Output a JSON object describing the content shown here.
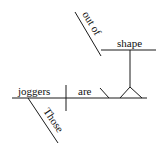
{
  "diagram": {
    "type": "sentence-diagram",
    "sentence": "Those joggers are out of shape",
    "words": {
      "subject": "joggers",
      "verb": "are",
      "subject_modifier": "Those",
      "predicate_prepositional_phrase": "out of",
      "object_of_phrase": "shape"
    }
  }
}
